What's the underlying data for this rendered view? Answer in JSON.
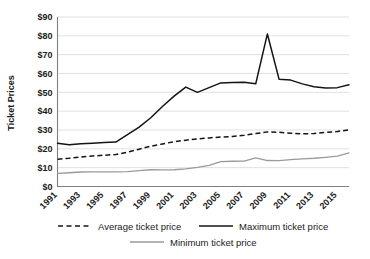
{
  "chart_data": {
    "type": "line",
    "title": "",
    "xlabel": "",
    "ylabel": "Ticket Prices",
    "ylim": [
      0,
      90
    ],
    "ytick_step": 10,
    "grid": true,
    "legend_position": "bottom",
    "x": [
      1991,
      1992,
      1993,
      1994,
      1995,
      1996,
      1997,
      1998,
      1999,
      2000,
      2001,
      2002,
      2003,
      2004,
      2005,
      2006,
      2007,
      2008,
      2009,
      2010,
      2011,
      2012,
      2013,
      2014,
      2015,
      2016
    ],
    "x_tick_labels": [
      "1991",
      "1993",
      "1995",
      "1997",
      "1999",
      "2001",
      "2003",
      "2005",
      "2007",
      "2009",
      "2011",
      "2013",
      "2015"
    ],
    "y_tick_labels": [
      "$0",
      "$10",
      "$20",
      "$30",
      "$40",
      "$50",
      "$60",
      "$70",
      "$80",
      "$90"
    ],
    "series": [
      {
        "name": "Average ticket price",
        "style": "dashed",
        "color": "#141414",
        "values": [
          14.5,
          15.0,
          15.7,
          16.2,
          16.6,
          17.0,
          18.2,
          19.8,
          21.4,
          22.6,
          23.8,
          24.6,
          25.3,
          25.8,
          26.3,
          26.5,
          27.2,
          28.1,
          29.0,
          28.8,
          28.3,
          28.0,
          28.1,
          28.7,
          29.2,
          30.1
        ]
      },
      {
        "name": "Maximum ticket price",
        "style": "solid",
        "color": "#141414",
        "values": [
          23.0,
          22.2,
          22.7,
          23.0,
          23.3,
          23.6,
          27.5,
          31.5,
          36.5,
          42.5,
          48.0,
          52.8,
          50.0,
          52.5,
          55.0,
          55.2,
          55.4,
          54.5,
          81.0,
          57.0,
          56.5,
          54.5,
          53.0,
          52.3,
          52.5,
          54.0
        ]
      },
      {
        "name": "Minimum ticket price",
        "style": "solid",
        "color": "#9a9a9a",
        "values": [
          7.0,
          7.3,
          7.7,
          7.8,
          7.8,
          7.8,
          7.9,
          8.4,
          8.9,
          8.8,
          8.9,
          9.4,
          10.2,
          11.2,
          13.2,
          13.4,
          13.5,
          15.2,
          13.8,
          13.7,
          14.3,
          14.7,
          15.0,
          15.5,
          16.1,
          17.8
        ]
      }
    ]
  },
  "legend": {
    "items": [
      {
        "label": "Average ticket price"
      },
      {
        "label": "Maximum ticket price"
      },
      {
        "label": "Minimum ticket price"
      }
    ]
  },
  "axis": {
    "y_title": "Ticket Prices"
  }
}
